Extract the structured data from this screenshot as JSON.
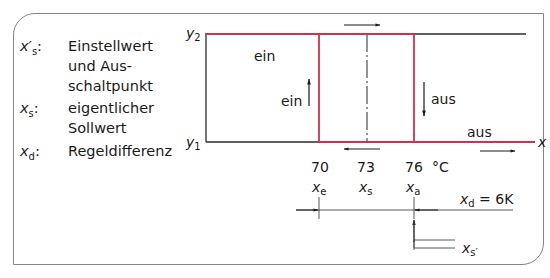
{
  "legend": [
    {
      "symbol": "x′",
      "sub": "s",
      "suffix": ":",
      "text": "Einstellwert und Aus-schaltpunkt",
      "lines": [
        "Einstellwert",
        "und Aus-",
        "schaltpunkt"
      ]
    },
    {
      "symbol": "x",
      "sub": "s",
      "suffix": ":",
      "text": "eigentlicher Sollwert",
      "lines": [
        "eigentlicher",
        "Sollwert"
      ]
    },
    {
      "symbol": "x",
      "sub": "d",
      "suffix": ":",
      "text": "Regeldifferenz",
      "lines": [
        "Regeldifferenz"
      ]
    }
  ],
  "diagram": {
    "y_top_label": "y",
    "y_top_sub": "2",
    "y_bottom_label": "y",
    "y_bottom_sub": "1",
    "x_axis_label": "x",
    "state_labels": {
      "top_left": "ein",
      "rising_edge": "ein",
      "falling_edge": "aus",
      "bottom_right": "aus"
    },
    "ticks": [
      {
        "value": "70",
        "symbol": "x",
        "sub": "e"
      },
      {
        "value": "73",
        "symbol": "x",
        "sub": "s"
      },
      {
        "value": "76",
        "symbol": "x",
        "sub": "a"
      }
    ],
    "unit": "°C",
    "difference_label": "x",
    "difference_sub": "d",
    "difference_value": " = 6K",
    "setpoint_pointer_label": "x",
    "setpoint_pointer_sub": "s′",
    "colors": {
      "hysteresis": "#d2304f",
      "line": "#2a2a2a",
      "frame": "#7f8683"
    }
  }
}
